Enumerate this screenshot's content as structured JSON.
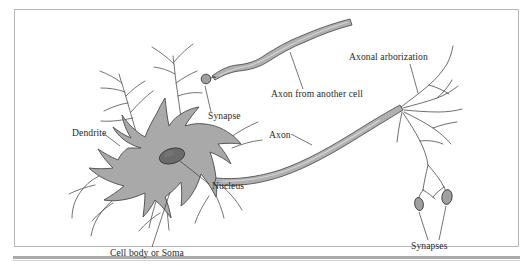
{
  "figure": {
    "background_color": "#ffffff",
    "frame_color": "#b9b9b9",
    "rule_color": "#a9a9a9"
  },
  "colors": {
    "soma_fill": "#a9a9a9",
    "soma_stroke": "#4a4a4a",
    "nucleus_fill": "#6b6b6b",
    "nucleus_stroke": "#3a3a3a",
    "axon_fill": "#b0b0b0",
    "axon_stroke": "#4a4a4a",
    "synapse_fill": "#a0a0a0",
    "synapse_stroke": "#3a3a3a",
    "label_color": "#2a2a2a",
    "leader_color": "#3a3a3a"
  },
  "labels": [
    {
      "id": "dendrite",
      "text": "Dendrite",
      "x": 72,
      "y": 136
    },
    {
      "id": "synapse",
      "text": "Synapse",
      "x": 208,
      "y": 119
    },
    {
      "id": "axon_from_other",
      "text": "Axon from another cell",
      "x": 271,
      "y": 97
    },
    {
      "id": "axonal_arborization",
      "text": "Axonal arborization",
      "x": 349,
      "y": 60
    },
    {
      "id": "axon",
      "text": "Axon",
      "x": 269,
      "y": 138
    },
    {
      "id": "nucleus",
      "text": "Nucleus",
      "x": 212,
      "y": 189
    },
    {
      "id": "cell_body",
      "text": "Cell body or Soma",
      "x": 110,
      "y": 256
    },
    {
      "id": "synapses",
      "text": "Synapses",
      "x": 411,
      "y": 249
    }
  ],
  "structures": {
    "soma": {
      "name": "Cell body or Soma",
      "shape": "star-polygon",
      "fill": "#a9a9a9"
    },
    "nucleus": {
      "name": "Nucleus",
      "shape": "ellipse",
      "cx": 172,
      "cy": 156,
      "rx": 12,
      "ry": 7,
      "fill": "#6b6b6b"
    },
    "synapse_bouton": {
      "name": "Synapse",
      "shape": "circle",
      "cx": 206,
      "cy": 79,
      "r": 4.6,
      "fill": "#a0a0a0"
    },
    "synapse_terminals": [
      {
        "name": "Synapses",
        "shape": "ellipse",
        "cx": 419,
        "cy": 204,
        "rx": 4.2,
        "ry": 6.5,
        "fill": "#a0a0a0"
      },
      {
        "name": "Synapses",
        "shape": "ellipse",
        "cx": 447,
        "cy": 197,
        "rx": 5.0,
        "ry": 7.2,
        "fill": "#a0a0a0"
      }
    ]
  }
}
